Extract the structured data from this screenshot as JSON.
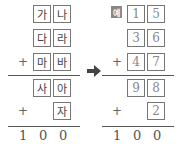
{
  "left": {
    "rows": [
      {
        "cells": [
          "가",
          "나"
        ],
        "operator": ""
      },
      {
        "cells": [
          "다",
          "라"
        ],
        "operator": ""
      },
      {
        "cells": [
          "마",
          "바"
        ],
        "operator": "+"
      }
    ],
    "partial_rows": [
      {
        "cells": [
          "사",
          "아"
        ],
        "operator": ""
      },
      {
        "cells": [
          "자"
        ],
        "operator": "+"
      }
    ],
    "result": [
      "1",
      "0",
      "0"
    ]
  },
  "arrow": {
    "icon": "right-arrow-icon"
  },
  "example": {
    "badge": "예",
    "rows": [
      {
        "cells": [
          "1",
          "5"
        ],
        "operator": ""
      },
      {
        "cells": [
          "3",
          "6"
        ],
        "operator": ""
      },
      {
        "cells": [
          "4",
          "7"
        ],
        "operator": "+"
      }
    ],
    "partial_rows": [
      {
        "cells": [
          "9",
          "8"
        ],
        "operator": ""
      },
      {
        "cells": [
          "2"
        ],
        "operator": "+"
      }
    ],
    "result": [
      "1",
      "0",
      "0"
    ]
  }
}
